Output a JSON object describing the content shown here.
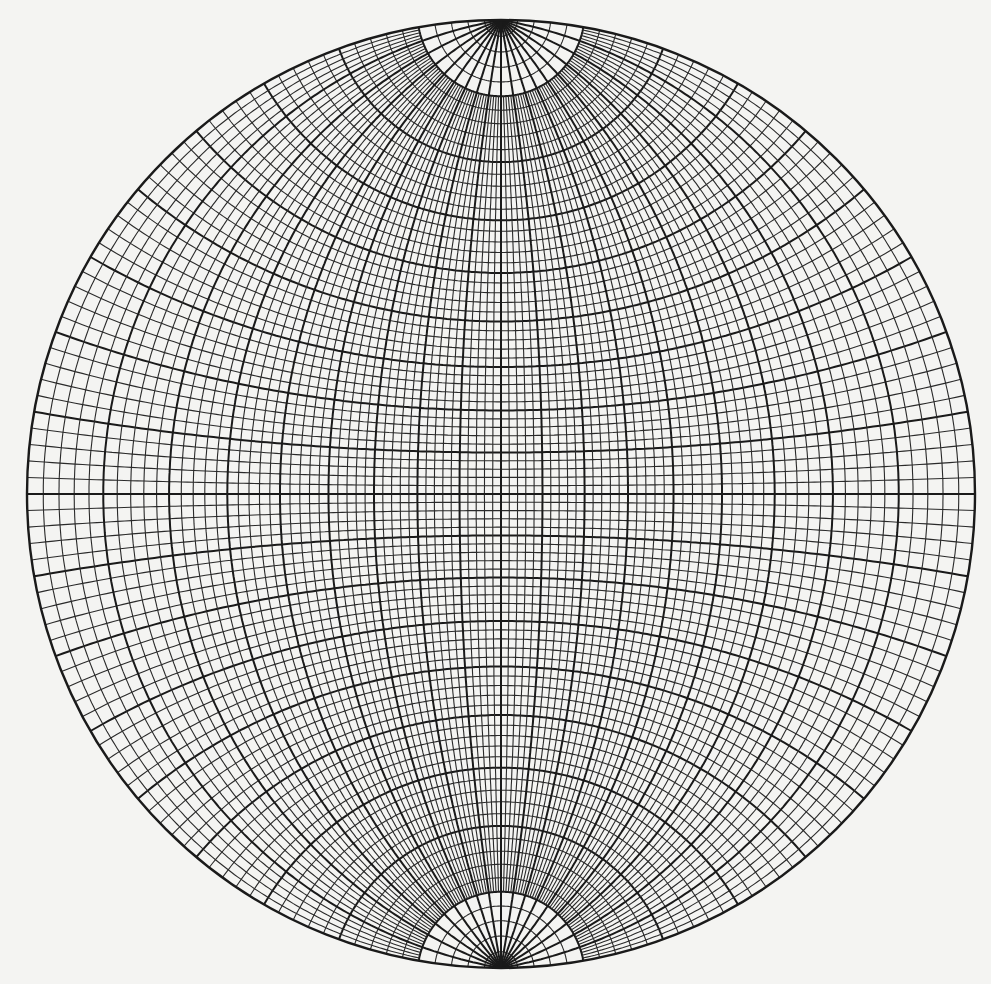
{
  "figure": {
    "title": "Wulff stereographic net",
    "type": "equal-angle stereonet",
    "background_color": "#f4f4f2",
    "line_color": "#1a1a1a"
  },
  "net": {
    "center_x": 501,
    "center_y": 494,
    "radius": 474,
    "minor_interval_deg": 2,
    "major_interval_deg": 10,
    "polar_cutoff_deg": 80,
    "polar_meridian_interval_deg": 10,
    "primary_circle": true
  }
}
